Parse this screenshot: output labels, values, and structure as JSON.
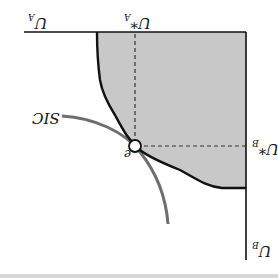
{
  "diagram": {
    "orientation": "rotated 180 degrees",
    "labels": {
      "axis_a": {
        "base": "U",
        "sub": "A"
      },
      "axis_a_star": {
        "base": "U*",
        "sub": "A"
      },
      "axis_b_star": {
        "base": "U*",
        "sub": "B"
      },
      "axis_b": {
        "base": "U",
        "sub": "B"
      },
      "sic": "SIC",
      "point": "e"
    },
    "colors": {
      "region_fill": "#c8c8c8",
      "frontier": "#111111",
      "sic_curve": "#6e6e6e",
      "axes": "#111111"
    }
  }
}
